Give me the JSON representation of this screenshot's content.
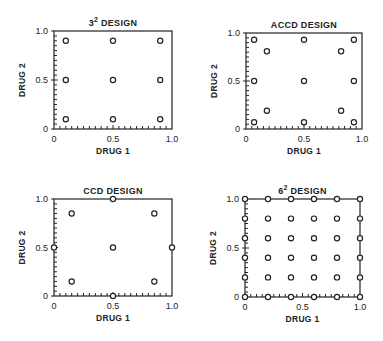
{
  "figure": {
    "background": "#ffffff",
    "ink_color": "#222222"
  },
  "chart_data": [
    {
      "type": "scatter",
      "title": "3² DESIGN",
      "title_base": "3",
      "title_sup": "2",
      "title_rest": " DESIGN",
      "xlabel": "DRUG 1",
      "ylabel": "DRUG 2",
      "xlim": [
        0,
        1.0
      ],
      "ylim": [
        0,
        1.0
      ],
      "xticks": [
        "0",
        "0.5",
        "1.0"
      ],
      "yticks": [
        "0",
        "0.5",
        "1.0"
      ],
      "box": {
        "x0": 54,
        "y0": 31,
        "x1": 172,
        "y1": 129
      },
      "points": [
        [
          0.1,
          0.9
        ],
        [
          0.5,
          0.9
        ],
        [
          0.9,
          0.9
        ],
        [
          0.1,
          0.5
        ],
        [
          0.5,
          0.5
        ],
        [
          0.9,
          0.5
        ],
        [
          0.1,
          0.1
        ],
        [
          0.5,
          0.1
        ],
        [
          0.9,
          0.1
        ]
      ]
    },
    {
      "type": "scatter",
      "title": "ACCD DESIGN",
      "title_base": "ACCD DESIGN",
      "title_sup": "",
      "title_rest": "",
      "xlabel": "DRUG 1",
      "ylabel": "DRUG 2",
      "xlim": [
        0,
        1.0
      ],
      "ylim": [
        0,
        1.0
      ],
      "xticks": [
        "0",
        "0.5",
        "1.0"
      ],
      "yticks": [
        "0",
        "0.5",
        "1.0"
      ],
      "box": {
        "x0": 246,
        "y0": 33,
        "x1": 362,
        "y1": 129
      },
      "points": [
        [
          0.07,
          0.93
        ],
        [
          0.5,
          0.93
        ],
        [
          0.93,
          0.93
        ],
        [
          0.18,
          0.81
        ],
        [
          0.82,
          0.81
        ],
        [
          0.07,
          0.5
        ],
        [
          0.5,
          0.5
        ],
        [
          0.93,
          0.5
        ],
        [
          0.18,
          0.19
        ],
        [
          0.82,
          0.19
        ],
        [
          0.07,
          0.07
        ],
        [
          0.5,
          0.07
        ],
        [
          0.93,
          0.07
        ]
      ]
    },
    {
      "type": "scatter",
      "title": "CCD DESIGN",
      "title_base": "CCD DESIGN",
      "title_sup": "",
      "title_rest": "",
      "xlabel": "DRUG 1",
      "ylabel": "DRUG 2",
      "xlim": [
        0,
        1.0
      ],
      "ylim": [
        0,
        1.0
      ],
      "xticks": [
        "0",
        "0.5",
        "1.0"
      ],
      "yticks": [
        "0",
        "0.5",
        "1.0"
      ],
      "box": {
        "x0": 54,
        "y0": 199,
        "x1": 172,
        "y1": 296
      },
      "points": [
        [
          0.5,
          1.0
        ],
        [
          0.15,
          0.85
        ],
        [
          0.85,
          0.85
        ],
        [
          0.0,
          0.5
        ],
        [
          0.5,
          0.5
        ],
        [
          1.0,
          0.5
        ],
        [
          0.15,
          0.15
        ],
        [
          0.85,
          0.15
        ],
        [
          0.5,
          0.0
        ]
      ]
    },
    {
      "type": "scatter",
      "title": "6² DESIGN",
      "title_base": "6",
      "title_sup": "2",
      "title_rest": " DESIGN",
      "xlabel": "DRUG 1",
      "ylabel": "DRUG 2",
      "xlim": [
        0,
        1.0
      ],
      "ylim": [
        0,
        1.0
      ],
      "xticks": [
        "0",
        "0.5",
        "1.0"
      ],
      "yticks": [
        "0",
        "0.5",
        "1.0"
      ],
      "box": {
        "x0": 245,
        "y0": 199,
        "x1": 360,
        "y1": 297
      },
      "grid_levels": [
        0,
        0.2,
        0.4,
        0.6,
        0.8,
        1.0
      ],
      "points": "all 36 combinations of grid_levels × grid_levels"
    }
  ]
}
